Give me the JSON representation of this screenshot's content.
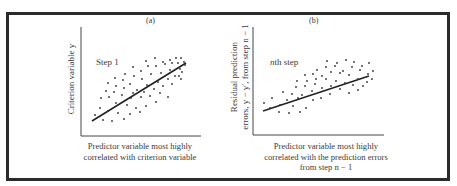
{
  "figure": {
    "frame_color": "#2b2b2b",
    "ink_color": "#333333"
  },
  "panels": [
    {
      "tag": "(a)",
      "step_label": "Step 1",
      "ylabel": "Criterion variable y",
      "xlabel_lines": [
        "Predictor variable most highly",
        "correlated with criterion variable"
      ],
      "line": {
        "x1": 92,
        "y1": 121,
        "x2": 186,
        "y2": 63
      },
      "axes": {
        "x0": 81,
        "ytop": 27,
        "ybottom": 136,
        "xright": 201
      },
      "points": [
        [
          95,
          115
        ],
        [
          103,
          120
        ],
        [
          112,
          121
        ],
        [
          124,
          119
        ],
        [
          100,
          108
        ],
        [
          108,
          111
        ],
        [
          118,
          113
        ],
        [
          130,
          114
        ],
        [
          140,
          112
        ],
        [
          101,
          98
        ],
        [
          109,
          97
        ],
        [
          116,
          103
        ],
        [
          127,
          105
        ],
        [
          136,
          108
        ],
        [
          146,
          106
        ],
        [
          156,
          102
        ],
        [
          106,
          91
        ],
        [
          114,
          92
        ],
        [
          122,
          95
        ],
        [
          131,
          98
        ],
        [
          141,
          97
        ],
        [
          150,
          96
        ],
        [
          160,
          93
        ],
        [
          168,
          97
        ],
        [
          108,
          83
        ],
        [
          116,
          86
        ],
        [
          124,
          88
        ],
        [
          133,
          93
        ],
        [
          144,
          92
        ],
        [
          154,
          89
        ],
        [
          163,
          86
        ],
        [
          172,
          84
        ],
        [
          115,
          78
        ],
        [
          123,
          80
        ],
        [
          130,
          84
        ],
        [
          137,
          90
        ],
        [
          147,
          85
        ],
        [
          158,
          82
        ],
        [
          168,
          79
        ],
        [
          175,
          76
        ],
        [
          181,
          79
        ],
        [
          125,
          74
        ],
        [
          134,
          76
        ],
        [
          142,
          79
        ],
        [
          151,
          74
        ],
        [
          161,
          73
        ],
        [
          170,
          70
        ],
        [
          180,
          69
        ],
        [
          133,
          67
        ],
        [
          141,
          71
        ],
        [
          148,
          66
        ],
        [
          156,
          66
        ],
        [
          165,
          64
        ],
        [
          172,
          63
        ],
        [
          178,
          63
        ],
        [
          184,
          62
        ],
        [
          146,
          61
        ],
        [
          155,
          58
        ],
        [
          163,
          62
        ],
        [
          170,
          60
        ],
        [
          176,
          58
        ],
        [
          181,
          58
        ],
        [
          185,
          65
        ],
        [
          182,
          72
        ],
        [
          179,
          76
        ]
      ]
    },
    {
      "tag": "(b)",
      "step_label_var": "n",
      "step_label": "th step",
      "ylabel_lines": [
        "Residual prediction",
        "errors, y − y′, from step n − 1"
      ],
      "xlabel_lines": [
        "Predictor variable most highly",
        "correlated with the prediction errors",
        "from step n − 1"
      ],
      "line": {
        "x1": 263,
        "y1": 111,
        "x2": 369,
        "y2": 76
      },
      "axes": {
        "x0": 253,
        "ytop": 27,
        "ybottom": 135,
        "xright": 384
      },
      "points": [
        [
          264,
          103
        ],
        [
          270,
          108
        ],
        [
          279,
          112
        ],
        [
          289,
          113
        ],
        [
          300,
          112
        ],
        [
          272,
          98
        ],
        [
          280,
          105
        ],
        [
          287,
          100
        ],
        [
          293,
          106
        ],
        [
          298,
          98
        ],
        [
          306,
          108
        ],
        [
          313,
          100
        ],
        [
          283,
          92
        ],
        [
          292,
          94
        ],
        [
          302,
          95
        ],
        [
          312,
          91
        ],
        [
          321,
          98
        ],
        [
          330,
          94
        ],
        [
          296,
          87
        ],
        [
          305,
          86
        ],
        [
          315,
          84
        ],
        [
          322,
          88
        ],
        [
          331,
          86
        ],
        [
          340,
          89
        ],
        [
          349,
          93
        ],
        [
          358,
          90
        ],
        [
          297,
          81
        ],
        [
          307,
          81
        ],
        [
          316,
          79
        ],
        [
          326,
          79
        ],
        [
          336,
          81
        ],
        [
          345,
          83
        ],
        [
          353,
          85
        ],
        [
          363,
          86
        ],
        [
          305,
          75
        ],
        [
          313,
          74
        ],
        [
          322,
          76
        ],
        [
          331,
          72
        ],
        [
          340,
          73
        ],
        [
          349,
          75
        ],
        [
          358,
          79
        ],
        [
          367,
          82
        ],
        [
          317,
          70
        ],
        [
          326,
          67
        ],
        [
          335,
          66
        ],
        [
          343,
          71
        ],
        [
          352,
          67
        ],
        [
          360,
          70
        ],
        [
          368,
          74
        ],
        [
          327,
          61
        ],
        [
          337,
          63
        ],
        [
          346,
          60
        ],
        [
          354,
          62
        ],
        [
          362,
          66
        ],
        [
          369,
          63
        ],
        [
          373,
          71
        ],
        [
          372,
          79
        ]
      ]
    }
  ]
}
